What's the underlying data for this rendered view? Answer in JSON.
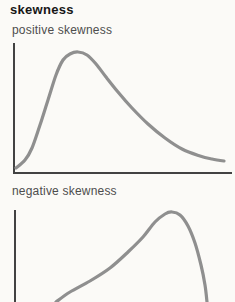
{
  "figure": {
    "title": "skewness",
    "colors": {
      "background": "#fbfaf7",
      "title_text": "#161616",
      "label_text": "#4d4d4d",
      "axis": "#424242",
      "curve": "#8f8f8f"
    },
    "charts": [
      {
        "id": "positive",
        "label": "positive skewness",
        "skew_direction": "positive",
        "description": "unimodal distribution curve with peak near left and long tail to the right",
        "viewbox": "0 0 235 135",
        "y_axis": [
          14,
          1,
          14,
          131
        ],
        "x_axis": [
          13,
          131,
          232,
          131
        ],
        "curve_points": [
          [
            16,
            126
          ],
          [
            25,
            118
          ],
          [
            32,
            106
          ],
          [
            40,
            83
          ],
          [
            48,
            58
          ],
          [
            56,
            33
          ],
          [
            63,
            18
          ],
          [
            70,
            12
          ],
          [
            78,
            10
          ],
          [
            87,
            13
          ],
          [
            96,
            22
          ],
          [
            106,
            35
          ],
          [
            118,
            50
          ],
          [
            132,
            66
          ],
          [
            148,
            82
          ],
          [
            165,
            96
          ],
          [
            182,
            107
          ],
          [
            200,
            114
          ],
          [
            212,
            117
          ],
          [
            224,
            119
          ]
        ]
      },
      {
        "id": "negative",
        "label": "negative skewness",
        "skew_direction": "negative",
        "description": "unimodal distribution curve with peak near right and long tail to the left, bottom cropped by image edge",
        "viewbox": "0 0 235 95",
        "y_axis": [
          15,
          3,
          15,
          95
        ],
        "x_axis": null,
        "curve_points": [
          [
            56,
            95
          ],
          [
            70,
            85
          ],
          [
            90,
            74
          ],
          [
            110,
            61
          ],
          [
            128,
            45
          ],
          [
            143,
            30
          ],
          [
            155,
            15
          ],
          [
            165,
            7
          ],
          [
            172,
            5
          ],
          [
            180,
            8
          ],
          [
            188,
            19
          ],
          [
            195,
            36
          ],
          [
            201,
            58
          ],
          [
            205,
            78
          ],
          [
            207,
            95
          ]
        ]
      }
    ]
  }
}
